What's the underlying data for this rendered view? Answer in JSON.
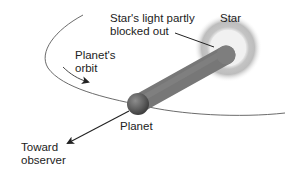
{
  "diagram": {
    "type": "transit-illustration",
    "labels": {
      "star": "Star",
      "blocked": [
        "Star's light partly",
        "blocked out"
      ],
      "orbit": [
        "Planet's",
        "orbit"
      ],
      "planet": "Planet",
      "observer": [
        "Toward",
        "observer"
      ]
    },
    "elements": {
      "star": {
        "cx": 228,
        "cy": 48,
        "core_radius": 18,
        "glow_radius": 33
      },
      "planet": {
        "cx": 138,
        "cy": 104,
        "radius": 11
      },
      "light_beam": {
        "from": [
          138,
          104
        ],
        "to": [
          228,
          54
        ],
        "width": 19
      },
      "orbit_path": "ellipse arc around star",
      "observer_arrow": {
        "from": [
          128,
          110
        ],
        "to": [
          66,
          144
        ]
      }
    },
    "colors": {
      "text": "#222222",
      "line": "#333333",
      "orbit": "#555555",
      "beam": "#7a7a7a",
      "planet": "#6a6a6a",
      "star_core": "#f2f2f2",
      "star_glow": "#9a9a9a",
      "background": "#ffffff"
    }
  }
}
